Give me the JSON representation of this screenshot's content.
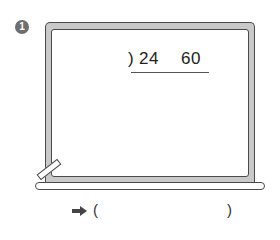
{
  "problem": {
    "number": "1",
    "division": {
      "bracket": ")",
      "dividend_values": [
        "24",
        "60"
      ]
    },
    "answer": {
      "arrow_icon": "right-arrow-icon",
      "open_paren": "(",
      "close_paren": ")",
      "value": ""
    }
  },
  "colors": {
    "frame": "#c9c9c9",
    "outline": "#4a4a4a",
    "badge": "#6e6e6e",
    "surface": "#ffffff"
  }
}
